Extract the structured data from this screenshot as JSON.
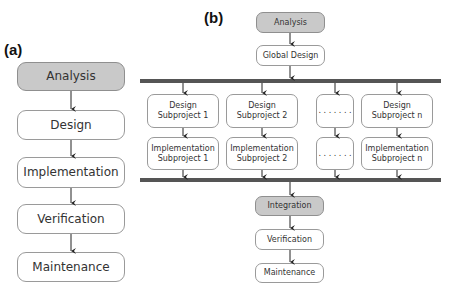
{
  "panels": {
    "a": {
      "label": "(a)",
      "steps": [
        {
          "text": "Analysis",
          "highlight": true
        },
        {
          "text": "Design",
          "highlight": false
        },
        {
          "text": "Implementation",
          "highlight": false
        },
        {
          "text": "Verification",
          "highlight": false
        },
        {
          "text": "Maintenance",
          "highlight": false
        }
      ]
    },
    "b": {
      "label": "(b)",
      "top": [
        {
          "text": "Analysis",
          "highlight": true
        },
        {
          "text": "Global Design",
          "highlight": false
        }
      ],
      "subprojects": [
        {
          "design": "Design\nSubproject 1",
          "implementation": "Implementation\nSubproject 1"
        },
        {
          "design": "Design\nSubproject 2",
          "implementation": "Implementation\nSubproject 2"
        },
        {
          "design": ". . . . . . .",
          "implementation": ". . . . . . ."
        },
        {
          "design": "Design\nSubproject n",
          "implementation": "Implementation\nSubproject n"
        }
      ],
      "bottom": [
        {
          "text": "Integration",
          "highlight": true
        },
        {
          "text": "Verification",
          "highlight": false
        },
        {
          "text": "Maintenance",
          "highlight": false
        }
      ]
    }
  },
  "colors": {
    "highlight_fill": "#c9c9c9",
    "bar": "#555555",
    "border": "#9a9a9a"
  }
}
